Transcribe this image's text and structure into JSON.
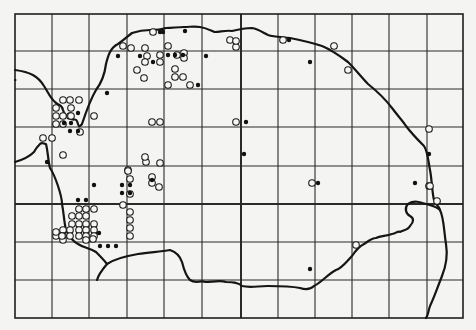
{
  "map": {
    "type": "distribution-grid-map",
    "colors": {
      "background": "#f4f4f2",
      "ink": "#151515"
    },
    "frame": {
      "x0": 15,
      "y0": 14,
      "x1": 463,
      "y1": 318
    },
    "grid": {
      "verticals": [
        52,
        89,
        127,
        164,
        202,
        278,
        315,
        352,
        389,
        427
      ],
      "thick_vertical": 241,
      "horizontals": [
        51,
        89,
        127,
        166,
        242,
        280
      ],
      "thick_horizontal": 204
    },
    "coastlines": [
      "M15,70 C30,72 38,76 44,86 C48,92 50,98 55,102 C58,106 62,104 63,110 C64,114 66,116 70,118 C74,122 76,116 78,124 C79,128 80,126 82,124",
      "M15,80 C16,80 15,80 15,80",
      "M82,124 C86,112 90,100 96,90 C102,82 105,72 106,64 C108,56 110,48 118,44 C124,40 128,36 132,33 C138,31 142,30 150,30 C156,30 160,30 166,28 C172,28 178,27 184,27 C190,27 194,26 200,27 C206,28 210,30 215,32 C220,32 226,30 232,31 C240,29 246,28 252,28 C258,29 262,32 268,35 C274,37 282,37 290,38 C300,40 310,42 322,46 C332,50 340,56 348,62 C356,70 362,78 368,84 C378,92 386,100 392,108 C398,116 402,120 406,126 C412,134 418,140 424,146 C428,152 428,160 430,170 C432,180 432,192 434,200 C436,206 438,204 440,210",
      "M440,210 C444,218 444,232 446,244 C448,256 446,266 442,276 C438,286 434,298 430,306 C428,312 428,316 426,318",
      "M15,162 C22,160 30,156 34,152 C36,148 38,146 40,144 C42,142 44,144 46,144 C48,152 48,160 50,168 C54,174 56,180 58,186 C60,192 62,198 62,204 C64,214 64,222 66,230 C70,238 74,242 78,244 C84,248 90,248 96,252 C100,256 104,260 107,264 C102,270 98,276 97,280",
      "M107,264 C116,258 126,256 138,254 C150,252 160,252 170,250 C176,252 180,256 182,262 C184,270 186,276 190,280 C196,284 200,280 206,282 C212,282 220,280 226,282 C232,282 238,282 242,286 C250,288 258,286 268,286 C278,286 290,286 300,288 C306,290 310,290 314,286 C322,282 328,274 336,270 C342,268 346,262 352,256 C356,250 360,246 364,244 C370,240 372,238 376,238 C380,236 386,236 392,234 C396,234 398,230 400,232 C404,230 408,230 410,226 C414,222 414,218 410,216 C406,214 404,208 408,204 C414,200 420,202 426,204 C432,206 436,206 440,210"
    ],
    "open_dots": [
      [
        153,
        32
      ],
      [
        123,
        46
      ],
      [
        131,
        48
      ],
      [
        145,
        48
      ],
      [
        168,
        46
      ],
      [
        184,
        53
      ],
      [
        184,
        58
      ],
      [
        230,
        40
      ],
      [
        236,
        47
      ],
      [
        236,
        41
      ],
      [
        147,
        56
      ],
      [
        160,
        55
      ],
      [
        145,
        62
      ],
      [
        160,
        62
      ],
      [
        177,
        55
      ],
      [
        137,
        70
      ],
      [
        144,
        78
      ],
      [
        175,
        69
      ],
      [
        175,
        77
      ],
      [
        183,
        77
      ],
      [
        168,
        85
      ],
      [
        190,
        85
      ],
      [
        283,
        40
      ],
      [
        334,
        46
      ],
      [
        348,
        70
      ],
      [
        63,
        100
      ],
      [
        70,
        100
      ],
      [
        79,
        100
      ],
      [
        71,
        108
      ],
      [
        56,
        108
      ],
      [
        56,
        116
      ],
      [
        63,
        116
      ],
      [
        70,
        116
      ],
      [
        56,
        124
      ],
      [
        63,
        124
      ],
      [
        71,
        116
      ],
      [
        94,
        116
      ],
      [
        80,
        132
      ],
      [
        43,
        138
      ],
      [
        52,
        138
      ],
      [
        63,
        155
      ],
      [
        152,
        122
      ],
      [
        160,
        122
      ],
      [
        236,
        122
      ],
      [
        429,
        129
      ],
      [
        429,
        186
      ],
      [
        437,
        201
      ],
      [
        128,
        170
      ],
      [
        146,
        162
      ],
      [
        160,
        163
      ],
      [
        152,
        177
      ],
      [
        152,
        183
      ],
      [
        159,
        187
      ],
      [
        130,
        179
      ],
      [
        128,
        171
      ],
      [
        145,
        157
      ],
      [
        123,
        205
      ],
      [
        130,
        194
      ],
      [
        130,
        212
      ],
      [
        130,
        220
      ],
      [
        130,
        228
      ],
      [
        130,
        236
      ],
      [
        79,
        209
      ],
      [
        86,
        209
      ],
      [
        94,
        209
      ],
      [
        72,
        216
      ],
      [
        79,
        216
      ],
      [
        86,
        216
      ],
      [
        72,
        224
      ],
      [
        79,
        224
      ],
      [
        86,
        224
      ],
      [
        94,
        224
      ],
      [
        63,
        230
      ],
      [
        70,
        230
      ],
      [
        79,
        230
      ],
      [
        86,
        230
      ],
      [
        94,
        230
      ],
      [
        56,
        236
      ],
      [
        63,
        236
      ],
      [
        70,
        236
      ],
      [
        79,
        236
      ],
      [
        86,
        236
      ],
      [
        94,
        236
      ],
      [
        63,
        240
      ],
      [
        86,
        240
      ],
      [
        93,
        239
      ],
      [
        312,
        183
      ],
      [
        430,
        186
      ],
      [
        356,
        245
      ],
      [
        56,
        232
      ],
      [
        62,
        236
      ]
    ],
    "filled_dots": [
      [
        160,
        32
      ],
      [
        163,
        32
      ],
      [
        185,
        31
      ],
      [
        118,
        56
      ],
      [
        140,
        56
      ],
      [
        153,
        62
      ],
      [
        168,
        55
      ],
      [
        175,
        55
      ],
      [
        183,
        55
      ],
      [
        206,
        56
      ],
      [
        198,
        85
      ],
      [
        107,
        93
      ],
      [
        78,
        113
      ],
      [
        64,
        123
      ],
      [
        71,
        123
      ],
      [
        70,
        131
      ],
      [
        78,
        131
      ],
      [
        289,
        40
      ],
      [
        310,
        62
      ],
      [
        246,
        122
      ],
      [
        47,
        162
      ],
      [
        152,
        180
      ],
      [
        122,
        185
      ],
      [
        130,
        185
      ],
      [
        122,
        193
      ],
      [
        130,
        193
      ],
      [
        94,
        185
      ],
      [
        78,
        200
      ],
      [
        86,
        200
      ],
      [
        99,
        233
      ],
      [
        108,
        246
      ],
      [
        116,
        246
      ],
      [
        100,
        246
      ],
      [
        318,
        183
      ],
      [
        415,
        183
      ],
      [
        429,
        154
      ],
      [
        310,
        269
      ],
      [
        244,
        154
      ]
    ]
  }
}
